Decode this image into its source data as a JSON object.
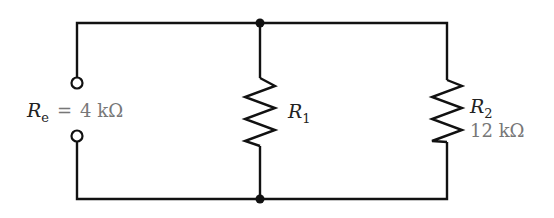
{
  "diagram": {
    "type": "circuit",
    "equivalent": {
      "symbol": "R",
      "subscript": "e",
      "equals": "=",
      "value": "4 kΩ"
    },
    "resistors": [
      {
        "id": "R1",
        "symbol": "R",
        "subscript": "1",
        "value": ""
      },
      {
        "id": "R2",
        "symbol": "R",
        "subscript": "2",
        "value": "12 kΩ"
      }
    ],
    "colors": {
      "wire": "#111111",
      "value_text": "#777777",
      "label_text": "#222222"
    }
  }
}
